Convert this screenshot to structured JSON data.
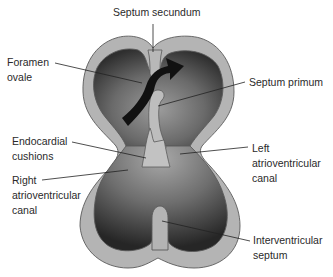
{
  "diagram": {
    "colors": {
      "background": "#ffffff",
      "wall": "#b4b4b4",
      "wall_outline": "#5a5a5a",
      "chamber_dark": "#2e2e2e",
      "chamber_light": "#9a9a9a",
      "arrow": "#111111",
      "leader_line": "#222222",
      "text": "#2a2a2a"
    },
    "labels": {
      "septum_secundum": [
        "Septum secundum"
      ],
      "foramen_ovale": [
        "Foramen",
        "ovale"
      ],
      "septum_primum": [
        "Septum primum"
      ],
      "endocardial_cushions": [
        "Endocardial",
        "cushions"
      ],
      "left_av_canal": [
        "Left",
        "atrioventricular",
        "canal"
      ],
      "right_av_canal": [
        "Right",
        "atrioventricular",
        "canal"
      ],
      "interventricular_septum": [
        "Interventricular",
        "septum"
      ]
    },
    "arrow": {
      "meaning": "blood-flow-through-foramen-ovale",
      "direction": "right-atrium-to-left-atrium"
    }
  }
}
